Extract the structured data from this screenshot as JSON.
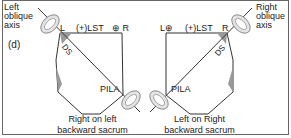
{
  "panel_label": "(d)",
  "left": {
    "axis_label_lines": [
      "Left",
      "oblique",
      "axis"
    ],
    "corner_L": "L",
    "lst": "(+)LST",
    "corner_R": "⊕ R",
    "ds": "DS",
    "pila": "PILA",
    "caption_lines": [
      "Right on left",
      "backward sacrum"
    ]
  },
  "right": {
    "axis_label_lines": [
      "Right",
      "oblique",
      "axis"
    ],
    "corner_L": "L⊕",
    "lst": "(+)LST",
    "corner_R": "R",
    "ds": "DS",
    "pila": "PILA",
    "caption_lines": [
      "Left on Right",
      "backward sacrum"
    ]
  },
  "colors": {
    "line": "#333333",
    "shade": "#9a9a9a",
    "arrow": "#c8c8c8",
    "border": "#555555"
  }
}
